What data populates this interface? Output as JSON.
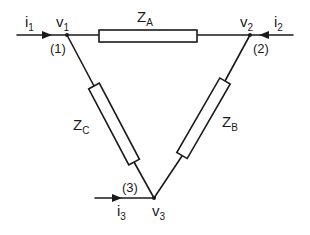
{
  "diagram": {
    "nodes": [
      {
        "id": "1",
        "voltage_label": "v",
        "voltage_sub": "1",
        "number_label": "(1)",
        "current_label": "i",
        "current_sub": "1"
      },
      {
        "id": "2",
        "voltage_label": "v",
        "voltage_sub": "2",
        "number_label": "(2)",
        "current_label": "i",
        "current_sub": "2"
      },
      {
        "id": "3",
        "voltage_label": "v",
        "voltage_sub": "3",
        "number_label": "(3)",
        "current_label": "i",
        "current_sub": "3"
      }
    ],
    "impedances": [
      {
        "id": "A",
        "label": "Z",
        "sub": "A",
        "between": [
          "1",
          "2"
        ]
      },
      {
        "id": "B",
        "label": "Z",
        "sub": "B",
        "between": [
          "2",
          "3"
        ]
      },
      {
        "id": "C",
        "label": "Z",
        "sub": "C",
        "between": [
          "1",
          "3"
        ]
      }
    ],
    "colors": {
      "line": "#1a1a1a",
      "background": "#ffffff"
    }
  }
}
